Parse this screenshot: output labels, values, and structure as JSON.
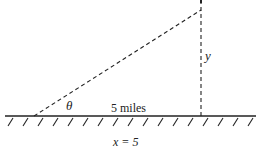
{
  "diagram": {
    "labels": {
      "angle": "θ",
      "distance": "5 miles",
      "height": "y",
      "equation": "x = 5"
    },
    "colors": {
      "line": "#222222",
      "background": "#ffffff"
    }
  }
}
